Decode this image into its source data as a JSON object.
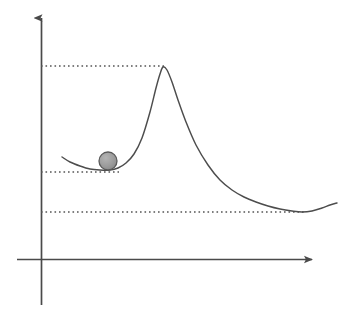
{
  "figure": {
    "title": "",
    "background_color": "#ffffff",
    "width": 357,
    "height": 322
  },
  "chart_data": {
    "type": "line",
    "title": "",
    "xlabel": "",
    "ylabel": "",
    "grid": false,
    "legend": null,
    "axis_style": "arrow-headed cartesian axes, no tick labels",
    "xlim": [
      0,
      357
    ],
    "ylim": [
      0,
      322
    ],
    "series": [
      {
        "name": "potential-energy-curve",
        "color": "#4d4d4d",
        "x": [
          62,
          70,
          80,
          90,
          100,
          110,
          118,
          126,
          134,
          142,
          150,
          156,
          160,
          163,
          167,
          172,
          178,
          186,
          196,
          208,
          220,
          232,
          244,
          256,
          268,
          280,
          292,
          302,
          312,
          322,
          330,
          337
        ],
        "y": [
          157,
          162,
          166,
          169,
          170,
          170,
          168,
          163,
          154,
          138,
          112,
          88,
          74,
          67,
          70,
          82,
          100,
          122,
          145,
          165,
          180,
          190,
          197,
          202,
          206,
          209,
          211,
          212,
          211,
          208,
          205,
          203
        ]
      }
    ],
    "marker": {
      "name": "ball",
      "shape": "circle",
      "cx": 108,
      "cy": 161,
      "r": 9,
      "fill_color": "#9a9a9a",
      "stroke_color": "#5a5a5a"
    },
    "level_lines": [
      {
        "name": "barrier-peak-level",
        "y": 66,
        "x_start": 41,
        "x_end": 164,
        "style": "dotted",
        "color": "#555555"
      },
      {
        "name": "local-minimum-level",
        "y": 172,
        "x_start": 41,
        "x_end": 119,
        "style": "dotted",
        "color": "#555555"
      },
      {
        "name": "global-minimum-level",
        "y": 212,
        "x_start": 41,
        "x_end": 306,
        "style": "dotted",
        "color": "#555555"
      }
    ],
    "axes": {
      "y_axis": {
        "name": "y-axis",
        "x": 41.5,
        "y_top": 15,
        "y_bottom": 305,
        "arrow": "up",
        "color": "#4a4a4a"
      },
      "x_axis": {
        "name": "x-axis",
        "y": 259.5,
        "x_left": 17,
        "x_right": 316,
        "arrow": "right",
        "color": "#4a4a4a"
      }
    },
    "annotations": []
  }
}
